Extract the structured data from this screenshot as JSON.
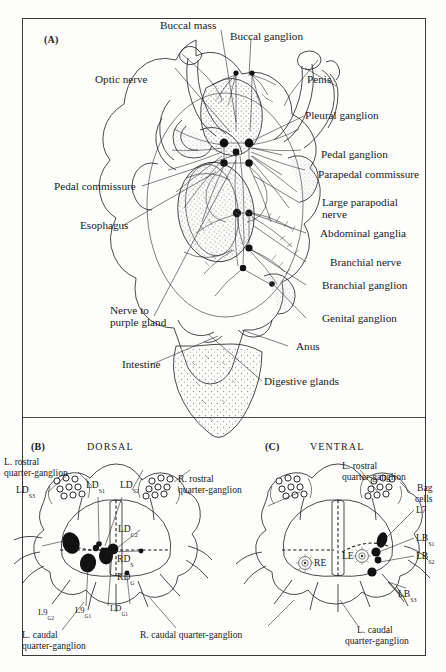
{
  "figure": {
    "panels": [
      {
        "id": "A",
        "letter": "(A)",
        "orientation": ""
      },
      {
        "id": "B",
        "letter": "(B)",
        "orientation": "DORSAL"
      },
      {
        "id": "C",
        "letter": "(C)",
        "orientation": "VENTRAL"
      }
    ]
  },
  "panel_a": {
    "letter": "(A)",
    "labels": [
      {
        "key": "buccal_mass",
        "text": "Buccal mass"
      },
      {
        "key": "buccal_ganglion",
        "text": "Buccal ganglion"
      },
      {
        "key": "optic_nerve",
        "text": "Optic nerve"
      },
      {
        "key": "penis",
        "text": "Penis"
      },
      {
        "key": "pleural_ganglion",
        "text": "Pleural ganglion"
      },
      {
        "key": "pedal_ganglion",
        "text": "Pedal ganglion"
      },
      {
        "key": "parapedal_commissure",
        "text": "Parapedal commissure"
      },
      {
        "key": "large_parapodial_nerve_1",
        "text": "Large parapodial"
      },
      {
        "key": "large_parapodial_nerve_2",
        "text": "nerve"
      },
      {
        "key": "abdominal_ganglia",
        "text": "Abdominal ganglia"
      },
      {
        "key": "branchial_nerve",
        "text": "Branchial nerve"
      },
      {
        "key": "branchial_ganglion",
        "text": "Branchial ganglion"
      },
      {
        "key": "genital_ganglion",
        "text": "Genital ganglion"
      },
      {
        "key": "anus",
        "text": "Anus"
      },
      {
        "key": "digestive_glands",
        "text": "Digestive glands"
      },
      {
        "key": "pedal_commissure",
        "text": "Pedal commissure"
      },
      {
        "key": "esophagus",
        "text": "Esophagus"
      },
      {
        "key": "nerve_to_purple_gland_1",
        "text": "Nerve to"
      },
      {
        "key": "nerve_to_purple_gland_2",
        "text": "purple gland"
      },
      {
        "key": "intestine",
        "text": "Intestine"
      }
    ]
  },
  "panel_b": {
    "letter": "(B)",
    "orientation": "DORSAL",
    "labels": [
      {
        "key": "l_rostral_1",
        "text": "L. rostral"
      },
      {
        "key": "l_rostral_2",
        "text": "quarter-ganglion"
      },
      {
        "key": "r_rostral_1",
        "text": "R. rostral"
      },
      {
        "key": "r_rostral_2",
        "text": "quarter-ganglion"
      },
      {
        "key": "l_caudal_1",
        "text": "L. caudal"
      },
      {
        "key": "l_caudal_2",
        "text": "quarter-ganglion"
      },
      {
        "key": "r_caudal",
        "text": "R. caudal quarter-ganglion"
      }
    ],
    "cells": [
      {
        "key": "ld_s3",
        "base": "LD",
        "sub": "S3"
      },
      {
        "key": "ld_s1",
        "base": "LD",
        "sub": "S1"
      },
      {
        "key": "ld_s2",
        "base": "LD",
        "sub": "S2"
      },
      {
        "key": "ld_c2",
        "base": "LD",
        "sub": "C2"
      },
      {
        "key": "rd_s",
        "base": "RD",
        "sub": "S"
      },
      {
        "key": "rd_g",
        "base": "RD",
        "sub": "G"
      },
      {
        "key": "l9_g2",
        "base": "L9",
        "sub": "G2"
      },
      {
        "key": "l9_g1",
        "base": "L9",
        "sub": "G1"
      },
      {
        "key": "ld_g1",
        "base": "LD",
        "sub": "G1"
      }
    ]
  },
  "panel_c": {
    "letter": "(C)",
    "orientation": "VENTRAL",
    "labels": [
      {
        "key": "l_rostral_1",
        "text": "L. rostral"
      },
      {
        "key": "l_rostral_2",
        "text": "quarter-ganglion"
      },
      {
        "key": "l_caudal_1",
        "text": "L. caudal"
      },
      {
        "key": "l_caudal_2",
        "text": "quarter-ganglion"
      },
      {
        "key": "bag_cells_1",
        "text": "Bag"
      },
      {
        "key": "bag_cells_2",
        "text": "cells"
      }
    ],
    "cells": [
      {
        "key": "l7",
        "base": "L7",
        "sub": ""
      },
      {
        "key": "lb_s1",
        "base": "LB",
        "sub": "S1"
      },
      {
        "key": "lb_s2",
        "base": "LB",
        "sub": "S2"
      },
      {
        "key": "lb_s3",
        "base": "LB",
        "sub": "S3"
      },
      {
        "key": "re",
        "base": "RE",
        "sub": ""
      },
      {
        "key": "le",
        "base": "LE",
        "sub": ""
      }
    ]
  },
  "colors": {
    "ink": "#1a1a1a",
    "line": "#2a2a2a",
    "stipple": "#8c8c8c",
    "paper": "#fdfdfc",
    "cell_fill": "#111111"
  }
}
